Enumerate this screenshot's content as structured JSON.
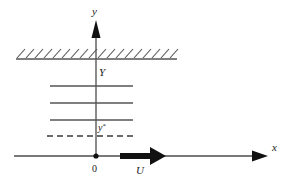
{
  "figure": {
    "background_color": "#ffffff",
    "line_color": "#555555",
    "accent_color": "#111111"
  },
  "axes": {
    "y_axis": {
      "label": "y",
      "icon": "up-arrow-icon",
      "x": 96,
      "y_top": 22,
      "y_bottom": 156
    },
    "x_axis": {
      "label": "x",
      "icon": "right-arrow-icon",
      "y": 156,
      "x_left": 14,
      "x_right": 268
    },
    "origin": {
      "label": "0",
      "x": 96,
      "y": 156
    }
  },
  "wall": {
    "name": "hatched-boundary",
    "label": "Y",
    "y": 59,
    "x_left": 16,
    "x_right": 177,
    "hatch_count": 19,
    "hatch_angle_deg": 45
  },
  "profile_lines": [
    {
      "y": 86,
      "x_left": 50,
      "x_right": 133,
      "style": "solid"
    },
    {
      "y": 103,
      "x_left": 50,
      "x_right": 133,
      "style": "solid"
    },
    {
      "y": 120,
      "x_left": 50,
      "x_right": 133,
      "style": "solid"
    },
    {
      "y": 136,
      "x_left": 47,
      "x_right": 133,
      "style": "dashed"
    }
  ],
  "annotations": {
    "y_star": {
      "base": "y",
      "superscript": "*",
      "x": 99,
      "y": 131
    },
    "wall_height": {
      "text": "Y",
      "x": 99,
      "y": 75
    }
  },
  "flow_arrow": {
    "name": "free-stream-velocity-arrow",
    "label": "U",
    "x_start": 120,
    "x_end": 166,
    "y": 156,
    "color": "#111111"
  }
}
